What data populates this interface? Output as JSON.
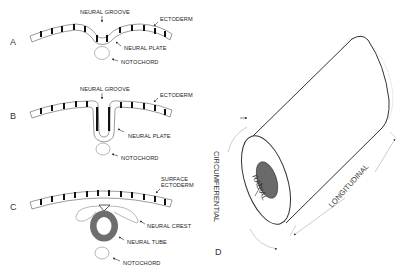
{
  "figure": {
    "panels": {
      "A": {
        "letter": "A",
        "labels": {
          "neural_groove": "NEURAL GROOVE",
          "ectoderm": "ECTODERM",
          "neural_plate": "NEURAL PLATE",
          "notochord": "NOTOCHORD"
        }
      },
      "B": {
        "letter": "B",
        "labels": {
          "neural_groove": "NEURAL GROOVE",
          "ectoderm": "ECTODERM",
          "neural_plate": "NEURAL PLATE",
          "notochord": "NOTOCHORD"
        }
      },
      "C": {
        "letter": "C",
        "labels": {
          "surface_ectoderm_1": "SURFACE",
          "surface_ectoderm_2": "ECTODERM",
          "neural_crest": "NEURAL CREST",
          "neural_tube": "NEURAL TUBE",
          "notochord": "NOTOCHORD"
        }
      },
      "D": {
        "letter": "D",
        "labels": {
          "circumferential": "CIRCUMFERENTIAL",
          "radial": "RADIAL",
          "longitudinal": "LONGITUDINAL"
        }
      }
    },
    "colors": {
      "stroke": "#333333",
      "tube_fill": "#6e6e6e",
      "lumen_fill": "#707070",
      "faint": "#bdbdbd"
    }
  }
}
